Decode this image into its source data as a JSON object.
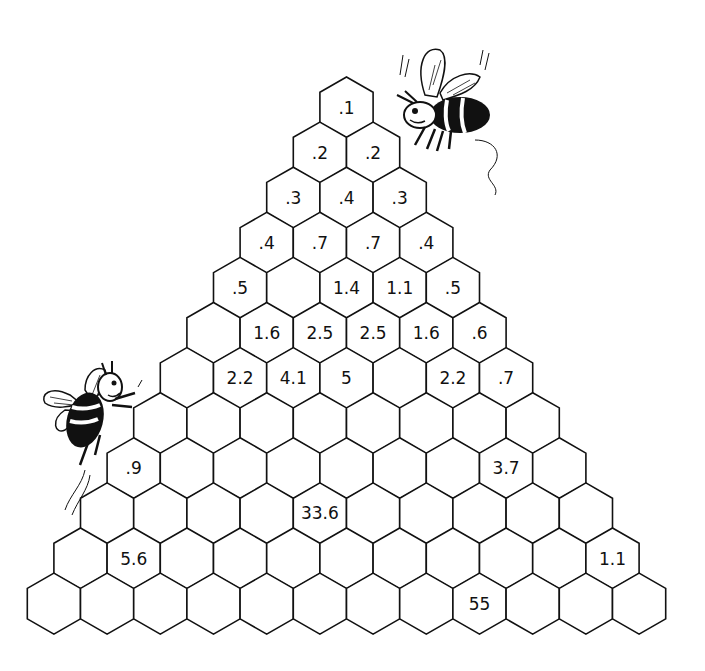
{
  "puzzle": {
    "title": "Hexagonal number pyramid",
    "row_count": 12,
    "rows": [
      [
        ".1"
      ],
      [
        ".2",
        ".2"
      ],
      [
        ".3",
        ".4",
        ".3"
      ],
      [
        ".4",
        ".7",
        ".7",
        ".4"
      ],
      [
        ".5",
        "",
        "1.4",
        "1.1",
        ".5"
      ],
      [
        "",
        "1.6",
        "2.5",
        "2.5",
        "1.6",
        ".6"
      ],
      [
        "",
        "2.2",
        "4.1",
        "5",
        "",
        "2.2",
        ".7"
      ],
      [
        "",
        "",
        "",
        "",
        "",
        "",
        "",
        ""
      ],
      [
        ".9",
        "",
        "",
        "",
        "",
        "",
        "",
        "3.7",
        ""
      ],
      [
        "",
        "",
        "",
        "",
        "33.6",
        "",
        "",
        "",
        "",
        ""
      ],
      [
        "",
        "5.6",
        "",
        "",
        "",
        "",
        "",
        "",
        "",
        "",
        "1.1"
      ],
      [
        "",
        "",
        "",
        "",
        "",
        "",
        "",
        "",
        "55",
        "",
        "",
        ""
      ]
    ],
    "colors": {
      "line": "#111111",
      "fill": "#ffffff",
      "text": "#111111"
    }
  },
  "decorations": {
    "bee_top_right": "bee-icon",
    "bee_left": "bee-icon"
  }
}
